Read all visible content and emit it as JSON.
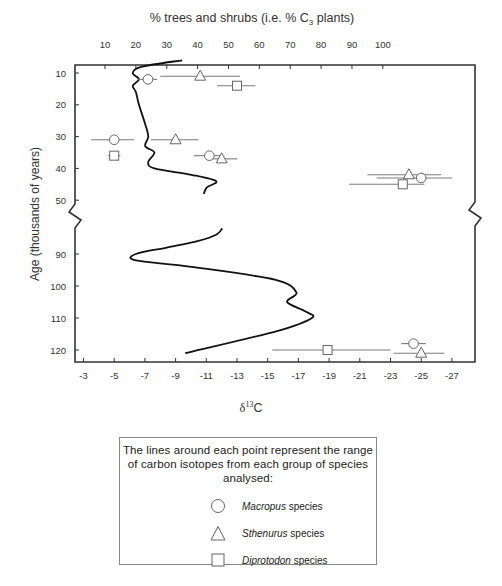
{
  "chart_data": {
    "type": "scatter",
    "title": "",
    "top_axis": {
      "label": "% trees and shrubs (i.e. % C3 plants)",
      "ticks": [
        10,
        20,
        30,
        40,
        50,
        60,
        70,
        80,
        90,
        100
      ]
    },
    "xlabel": "δ13C",
    "xlim": [
      -2,
      -28
    ],
    "x_ticks": [
      -3,
      -5,
      -7,
      -9,
      -11,
      -13,
      -15,
      -17,
      -19,
      -21,
      -23,
      -25,
      -27
    ],
    "ylabel": "Age (thousands of years)",
    "y_ticks_upper": [
      10,
      20,
      30,
      40,
      50
    ],
    "y_ticks_lower": [
      90,
      100,
      110,
      120
    ],
    "axis_break": {
      "between": [
        50,
        80
      ]
    },
    "grid": false,
    "series": [
      {
        "name": "Macropus species",
        "marker": "circle",
        "points": [
          {
            "age": 12,
            "d13C": -7.2,
            "range": [
              -6.5,
              -7.8
            ]
          },
          {
            "age": 31,
            "d13C": -5.0,
            "range": [
              -3.5,
              -6.3
            ]
          },
          {
            "age": 36,
            "d13C": -11.2,
            "range": [
              -10.2,
              -12.0
            ]
          },
          {
            "age": 43,
            "d13C": -25.0,
            "range": [
              -22.1,
              -27.0
            ]
          },
          {
            "age": 118,
            "d13C": -24.5,
            "range": [
              -23.7,
              -25.3
            ]
          }
        ]
      },
      {
        "name": "Sthenurus species",
        "marker": "triangle",
        "points": [
          {
            "age": 11,
            "d13C": -10.6,
            "range": [
              -8.0,
              -13.2
            ]
          },
          {
            "age": 31,
            "d13C": -9.0,
            "range": [
              -7.4,
              -10.5
            ]
          },
          {
            "age": 37,
            "d13C": -12.0,
            "range": [
              -11.1,
              -13.0
            ]
          },
          {
            "age": 42,
            "d13C": -24.2,
            "range": [
              -21.5,
              -26.3
            ]
          },
          {
            "age": 121,
            "d13C": -25.0,
            "range": [
              -23.2,
              -26.5
            ]
          }
        ]
      },
      {
        "name": "Diprotodon species",
        "marker": "square",
        "points": [
          {
            "age": 14,
            "d13C": -13.0,
            "range": [
              -11.7,
              -14.2
            ]
          },
          {
            "age": 36,
            "d13C": -5.0,
            "range": [
              -4.6,
              -5.4
            ]
          },
          {
            "age": 45,
            "d13C": -23.8,
            "range": [
              -20.3,
              -25.2
            ]
          },
          {
            "age": 120,
            "d13C": -18.9,
            "range": [
              -15.3,
              -23.0
            ]
          }
        ]
      }
    ],
    "curve": {
      "name": "% trees and shrubs",
      "upper_segment": [
        {
          "age": 6,
          "pct": 35
        },
        {
          "age": 8,
          "pct": 22
        },
        {
          "age": 10,
          "pct": 19
        },
        {
          "age": 12,
          "pct": 21
        },
        {
          "age": 14,
          "pct": 19
        },
        {
          "age": 16,
          "pct": 20
        },
        {
          "age": 20,
          "pct": 21
        },
        {
          "age": 26,
          "pct": 23
        },
        {
          "age": 30,
          "pct": 24
        },
        {
          "age": 33,
          "pct": 23
        },
        {
          "age": 35,
          "pct": 26
        },
        {
          "age": 38,
          "pct": 24
        },
        {
          "age": 40,
          "pct": 26
        },
        {
          "age": 42,
          "pct": 38
        },
        {
          "age": 44,
          "pct": 46
        },
        {
          "age": 46,
          "pct": 43
        },
        {
          "age": 48,
          "pct": 42
        }
      ],
      "lower_segment": [
        {
          "age": 82,
          "pct": 48
        },
        {
          "age": 84,
          "pct": 46
        },
        {
          "age": 86,
          "pct": 40
        },
        {
          "age": 88,
          "pct": 30
        },
        {
          "age": 90,
          "pct": 20
        },
        {
          "age": 92,
          "pct": 20
        },
        {
          "age": 94,
          "pct": 38
        },
        {
          "age": 98,
          "pct": 65
        },
        {
          "age": 102,
          "pct": 72
        },
        {
          "age": 105,
          "pct": 69
        },
        {
          "age": 108,
          "pct": 75
        },
        {
          "age": 110,
          "pct": 77
        },
        {
          "age": 114,
          "pct": 66
        },
        {
          "age": 121,
          "pct": 36
        }
      ]
    },
    "legend_position": "below"
  },
  "legend": {
    "note": "The lines around each point represent the range of carbon isotopes from each group of species analysed:",
    "items": [
      {
        "genus": "Macropus",
        "suffix": " species",
        "symbol": "circle-icon"
      },
      {
        "genus": "Sthenurus",
        "suffix": " species",
        "symbol": "triangle-icon"
      },
      {
        "genus": "Diprotodon",
        "suffix": " species",
        "symbol": "square-icon"
      }
    ]
  },
  "colors": {
    "axis": "#333333",
    "curve": "#111111",
    "range_line": "#7a7a7a",
    "marker_stroke": "#666666",
    "text": "#333333"
  }
}
